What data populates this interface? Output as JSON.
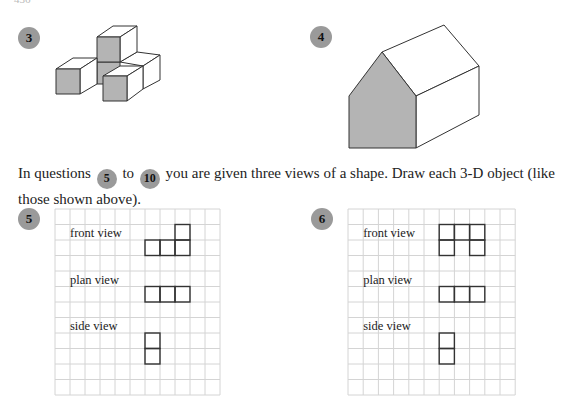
{
  "page_fragment": "436",
  "questions": {
    "q3": {
      "number": "3"
    },
    "q4": {
      "number": "4"
    }
  },
  "instructions": {
    "prefix": "In questions",
    "from_badge": "5",
    "middle": "to",
    "to_badge": "10",
    "suffix": "you are given three views of a shape. Draw each 3-D object (like those shown above)."
  },
  "grids": [
    {
      "number": "5",
      "columns": 11,
      "rows": 12,
      "labels": {
        "front": "front view",
        "plan": "plan view",
        "side": "side view"
      },
      "front_cells": [
        [
          1,
          8
        ],
        [
          2,
          6
        ],
        [
          2,
          7
        ],
        [
          2,
          8
        ]
      ],
      "plan_cells": [
        [
          5,
          6
        ],
        [
          5,
          7
        ],
        [
          5,
          8
        ]
      ],
      "side_cells": [
        [
          8,
          6
        ],
        [
          9,
          6
        ]
      ]
    },
    {
      "number": "6",
      "columns": 11,
      "rows": 12,
      "labels": {
        "front": "front view",
        "plan": "plan view",
        "side": "side view"
      },
      "front_cells": [
        [
          1,
          6
        ],
        [
          1,
          7
        ],
        [
          1,
          8
        ],
        [
          2,
          6
        ],
        [
          2,
          8
        ]
      ],
      "plan_cells": [
        [
          5,
          6
        ],
        [
          5,
          7
        ],
        [
          5,
          8
        ]
      ],
      "side_cells": [
        [
          8,
          6
        ],
        [
          9,
          6
        ]
      ]
    }
  ],
  "colors": {
    "shade": "#b4b4b4",
    "badge": "#9a9a9a",
    "grid_line": "#d4d4d4",
    "outline": "#333333"
  }
}
